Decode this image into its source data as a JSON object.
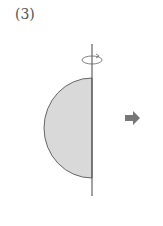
{
  "problem": {
    "label": "(3)"
  },
  "figure": {
    "shape": "semicircle",
    "fill": "#d9d9d9",
    "stroke": "#555555",
    "axis": "vertical-rotation-axis",
    "arrow_color": "#777777"
  }
}
